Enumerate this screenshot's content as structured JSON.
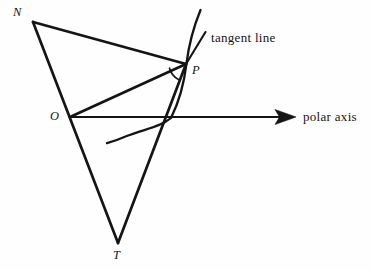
{
  "figure": {
    "kind": "geometry-diagram",
    "title_visible": false,
    "background_color": "#fffefe",
    "ink_color": "#141414",
    "width": 373,
    "height": 270,
    "labels": {
      "point_n": "N",
      "point_o": "O",
      "point_p": "P",
      "point_t": "T",
      "tangent_line": "tangent line",
      "polar_axis": "polar axis"
    },
    "points": {
      "N": {
        "x": 33,
        "y": 22
      },
      "O": {
        "x": 70,
        "y": 117
      },
      "P": {
        "x": 186,
        "y": 64
      },
      "T": {
        "x": 118,
        "y": 243
      },
      "axis_start": {
        "x": 70,
        "y": 117
      },
      "axis_tip": {
        "x": 296,
        "y": 117
      },
      "tangent_top": {
        "x": 205,
        "y": 33
      },
      "curve_top": {
        "x": 200,
        "y": 10
      },
      "curve_tail": {
        "x": 107,
        "y": 143
      }
    },
    "segments": [
      {
        "name": "segment-NP",
        "from": "N",
        "to": "P",
        "width": 2.6
      },
      {
        "name": "segment-NOT",
        "from": "N",
        "to": "T",
        "width": 2.6
      },
      {
        "name": "segment-OP",
        "from": "O",
        "to": "P",
        "width": 2.6
      },
      {
        "name": "segment-PT",
        "from": "P",
        "to": "T",
        "width": 2.6
      },
      {
        "name": "tangent-line-PT-extended",
        "from": "P",
        "to": "tangent_top",
        "width": 2.0
      }
    ],
    "curve": {
      "name": "polar-spiral-curve",
      "path": "M 200 10 C 193 28, 188 48, 186 64 C 183 85, 178 102, 170 118 C 158 127, 140 130, 124 137 C 117 140, 111 142, 107 143",
      "width": 2.2
    },
    "angle_mark": {
      "name": "psi-angle-arc-at-P",
      "path": "M 170 69 A 17 17 0 0 0 179 79",
      "width": 1.6
    },
    "axis": {
      "name": "polar-axis-arrow",
      "width": 1.8,
      "arrow_head": "M 296 117 L 276 110 L 280 117 L 276 124 Z"
    }
  }
}
